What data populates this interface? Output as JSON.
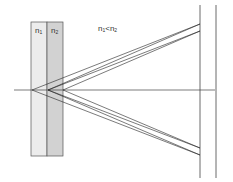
{
  "diagram": {
    "slab1": {
      "label": "n",
      "subscript": "1",
      "fill": "#ececec"
    },
    "slab2": {
      "label": "n",
      "subscript": "2",
      "fill": "#d2d2d2"
    },
    "relation": {
      "a": "n",
      "a_sub": "1",
      "op": "<",
      "b": "n",
      "b_sub": "2"
    },
    "line_color": "#222222"
  }
}
